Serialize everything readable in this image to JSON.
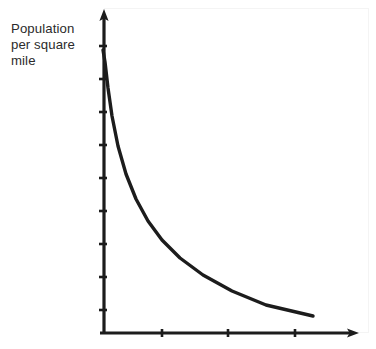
{
  "chart_data": {
    "type": "line",
    "title": "",
    "subtitle": "",
    "ylabel_lines": [
      "Population",
      "per square",
      "mile"
    ],
    "ylabel": "Population per square mile",
    "xlabel": "",
    "legend": [],
    "annotations": [],
    "grid": false,
    "axis_style": "arrow-headed, no numeric tick labels",
    "y_tick_labels": [],
    "x_tick_labels": [],
    "y_tick_count": 9,
    "x_tick_count": 3,
    "xlim": [
      0,
      1
    ],
    "ylim": [
      0,
      1
    ],
    "series": [
      {
        "name": "population density decay",
        "shape": "exponential decay",
        "x": [
          0.0,
          0.02,
          0.05,
          0.09,
          0.14,
          0.2,
          0.27,
          0.35,
          0.44,
          0.55,
          0.67,
          0.8,
          0.92,
          1.0
        ],
        "y": [
          1.0,
          0.88,
          0.7,
          0.55,
          0.44,
          0.35,
          0.28,
          0.23,
          0.19,
          0.15,
          0.12,
          0.09,
          0.07,
          0.06
        ]
      }
    ]
  },
  "colors": {
    "ink": "#1c1c1c",
    "label_text": "#2b2b2b",
    "background": "#ffffff",
    "plot_border": "#f4f4f4"
  },
  "geometry": {
    "y_axis_x": 104,
    "x_axis_y": 333,
    "y_axis_top": 12,
    "x_axis_right": 358,
    "y_ticks_px": [
      46,
      79,
      112,
      145,
      178,
      211,
      244,
      277,
      310
    ],
    "x_ticks_px": [
      162,
      228,
      295
    ],
    "curve_points_px": "103,50 105,62 108,88 112,116 118,146 126,174 136,199 148,221 162,240 180,258 203,275 232,291 266,305 313,316"
  }
}
